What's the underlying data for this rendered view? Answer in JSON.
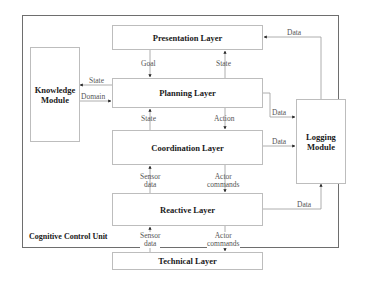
{
  "diagram": {
    "container": {
      "title": "Cognitive Control Unit"
    },
    "layers": [
      {
        "id": "presentation",
        "label": "Presentation Layer"
      },
      {
        "id": "planning",
        "label": "Planning Layer"
      },
      {
        "id": "coordination",
        "label": "Coordination Layer"
      },
      {
        "id": "reactive",
        "label": "Reactive Layer"
      },
      {
        "id": "technical",
        "label": "Technical Layer"
      }
    ],
    "modules": {
      "knowledge": {
        "line1": "Knowledge",
        "line2": "Module"
      },
      "logging": {
        "line1": "Logging",
        "line2": "Module"
      }
    },
    "edges": {
      "presentation_to_planning": "Goal",
      "planning_to_presentation": "State",
      "planning_to_knowledge": "State",
      "knowledge_to_planning": "Domain",
      "coordination_to_planning": "State",
      "planning_to_coordination": "Action",
      "reactive_to_coordination": {
        "line1": "Sensor",
        "line2": "data"
      },
      "coordination_to_reactive": {
        "line1": "Actor",
        "line2": "commands"
      },
      "technical_to_reactive": {
        "line1": "Sensor",
        "line2": "data"
      },
      "reactive_to_technical": {
        "line1": "Actor",
        "line2": "commands"
      },
      "logging_to_presentation": "Data",
      "planning_to_logging": "Data",
      "coordination_to_logging": "Data",
      "reactive_to_logging": "Data"
    },
    "colors": {
      "box_border": "#bdbdbd",
      "frame_border": "#6e6e6e",
      "line": "#9a9a9a",
      "arrowhead": "#222222"
    }
  }
}
